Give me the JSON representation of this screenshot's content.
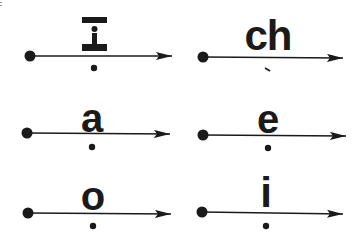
{
  "diagram": {
    "title": "",
    "colors": {
      "ink": "#1a1a1a",
      "background": "#ffffff"
    },
    "items": [
      {
        "id": "I",
        "label": "I",
        "glyph_type": "special-I-with-dot",
        "below_marker": "dot",
        "row": 1,
        "col": 1
      },
      {
        "id": "ch",
        "label": "ch",
        "glyph_type": "text",
        "below_marker": "tick",
        "row": 1,
        "col": 2
      },
      {
        "id": "a",
        "label": "a",
        "glyph_type": "text",
        "below_marker": "dot",
        "row": 2,
        "col": 1
      },
      {
        "id": "e",
        "label": "e",
        "glyph_type": "text",
        "below_marker": "dot",
        "row": 2,
        "col": 2
      },
      {
        "id": "o",
        "label": "o",
        "glyph_type": "text",
        "below_marker": "dot",
        "row": 3,
        "col": 1
      },
      {
        "id": "i",
        "label": "i",
        "glyph_type": "text",
        "below_marker": "dot",
        "row": 3,
        "col": 2
      }
    ]
  }
}
